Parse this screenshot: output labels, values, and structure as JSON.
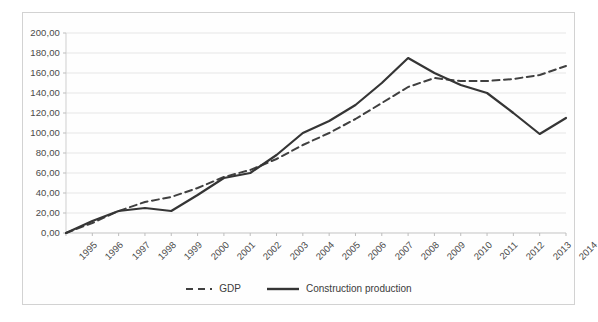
{
  "chart_data": {
    "type": "line",
    "title": "",
    "xlabel": "",
    "ylabel": "",
    "x": [
      1995,
      1996,
      1997,
      1998,
      1999,
      2000,
      2001,
      2002,
      2003,
      2004,
      2005,
      2006,
      2007,
      2008,
      2009,
      2010,
      2011,
      2012,
      2013,
      2014
    ],
    "categories": [
      "1995",
      "1996",
      "1997",
      "1998",
      "1999",
      "2000",
      "2001",
      "2002",
      "2003",
      "2004",
      "2005",
      "2006",
      "2007",
      "2008",
      "2009",
      "2010",
      "2011",
      "2012",
      "2013",
      "2014"
    ],
    "series": [
      {
        "name": "GDP",
        "style": "dashed",
        "color": "#404040",
        "values": [
          0.0,
          10.0,
          22.0,
          31.0,
          36.0,
          45.0,
          56.0,
          63.0,
          74.0,
          88.0,
          100.0,
          114.0,
          130.0,
          146.0,
          155.0,
          152.0,
          152.0,
          154.0,
          158.0,
          167.0
        ]
      },
      {
        "name": "Construction production",
        "style": "solid",
        "color": "#353535",
        "values": [
          0.0,
          12.0,
          22.0,
          25.0,
          22.0,
          38.0,
          55.0,
          60.0,
          78.0,
          100.0,
          112.0,
          128.0,
          150.0,
          175.0,
          160.0,
          148.0,
          140.0,
          120.0,
          99.0,
          115.0
        ]
      }
    ],
    "ylim": [
      0,
      200
    ],
    "yticks": [
      0,
      20,
      40,
      60,
      80,
      100,
      120,
      140,
      160,
      180,
      200
    ],
    "ytick_labels": [
      "0,00",
      "20,00",
      "40,00",
      "60,00",
      "80,00",
      "100,00",
      "120,00",
      "140,00",
      "160,00",
      "180,00",
      "200,00"
    ],
    "grid": true,
    "grid_axis": "y",
    "legend_position": "bottom",
    "legend_entries": [
      "GDP",
      "Construction production"
    ]
  }
}
